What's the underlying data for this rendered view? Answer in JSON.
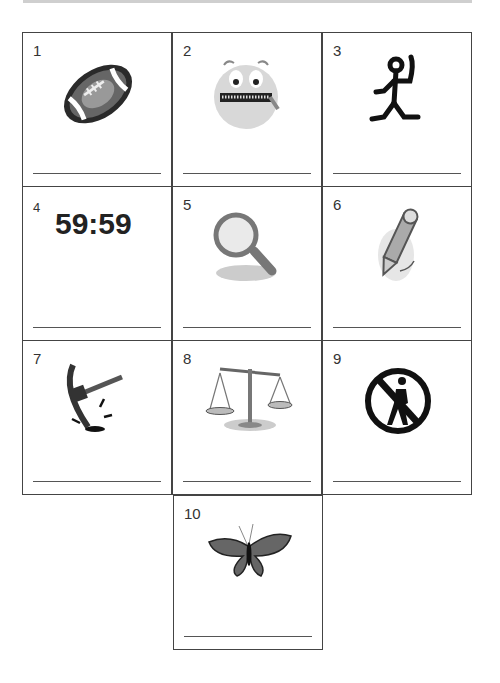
{
  "worksheet": {
    "items": [
      {
        "number": "1",
        "icon": "football-icon"
      },
      {
        "number": "2",
        "icon": "zipped-mouth-face-icon"
      },
      {
        "number": "3",
        "icon": "stick-figure-icon"
      },
      {
        "number": "4",
        "icon": "clock-text",
        "text": "59:59"
      },
      {
        "number": "5",
        "icon": "magnifying-glass-icon"
      },
      {
        "number": "6",
        "icon": "pencil-icon"
      },
      {
        "number": "7",
        "icon": "pickaxe-icon"
      },
      {
        "number": "8",
        "icon": "balance-scale-icon"
      },
      {
        "number": "9",
        "icon": "no-pedestrian-icon"
      },
      {
        "number": "10",
        "icon": "butterfly-icon"
      }
    ]
  }
}
